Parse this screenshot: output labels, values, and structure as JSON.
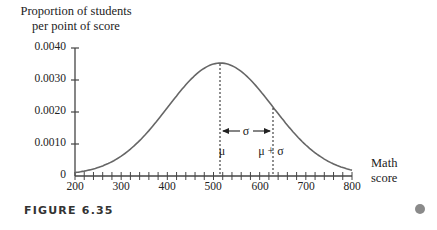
{
  "chart_data": {
    "type": "line",
    "title": "",
    "ylabel": "Proportion of students per point of score",
    "xlabel": "Math score",
    "xlim": [
      200,
      800
    ],
    "ylim": [
      0,
      0.004
    ],
    "x_ticks": [
      "200",
      "300",
      "400",
      "500",
      "600",
      "700",
      "800"
    ],
    "y_ticks": [
      "0",
      "0.0010",
      "0.0020",
      "0.0030",
      "0.0040"
    ],
    "series": [
      {
        "name": "Normal distribution of math scores",
        "distribution": "normal",
        "mean": 515,
        "sd": 114,
        "x": [
          200,
          250,
          300,
          350,
          400,
          450,
          500,
          515,
          550,
          600,
          650,
          700,
          750,
          800
        ],
        "values": [
          8e-05,
          0.00024,
          0.00059,
          0.00122,
          0.00211,
          0.003,
          0.00346,
          0.0035,
          0.00334,
          0.00264,
          0.00172,
          0.00093,
          0.00041,
          0.00015
        ]
      }
    ],
    "annotations": [
      "μ",
      "μ + σ",
      "σ"
    ],
    "grid": false
  },
  "labels": {
    "ylabel_line1": "Proportion of students",
    "ylabel_line2": "per point of score",
    "xlabel_line1": "Math",
    "xlabel_line2": "score",
    "mu": "μ",
    "mu_plus_sigma": "μ + σ",
    "sigma": "σ"
  },
  "caption": "FIGURE 6.35"
}
